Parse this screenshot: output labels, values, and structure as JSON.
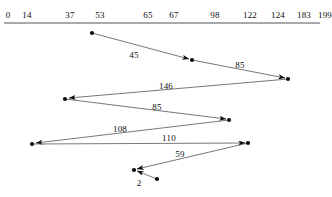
{
  "figure": {
    "type": "tour-diagram",
    "background_color": "#ffffff",
    "ink_color": "#0d0d0d",
    "line_color": "#555555",
    "width": 332,
    "height": 197
  },
  "axis": {
    "name": "position-axis",
    "y": 23,
    "x_start": 4,
    "x_end": 320,
    "ticks": [
      {
        "label": "0",
        "x": 8
      },
      {
        "label": "14",
        "x": 27
      },
      {
        "label": "37",
        "x": 70
      },
      {
        "label": "53",
        "x": 100
      },
      {
        "label": "65",
        "x": 148
      },
      {
        "label": "67",
        "x": 174
      },
      {
        "label": "98",
        "x": 215
      },
      {
        "label": "122",
        "x": 250
      },
      {
        "label": "124",
        "x": 278
      },
      {
        "label": "183",
        "x": 304
      },
      {
        "label": "199",
        "x": 325
      }
    ]
  },
  "nodes": [
    {
      "name": "node-start",
      "x": 92,
      "y": 33
    },
    {
      "name": "node-mid-1",
      "x": 192,
      "y": 60
    },
    {
      "name": "node-right-1",
      "x": 288,
      "y": 79
    },
    {
      "name": "node-left-1",
      "x": 65,
      "y": 99
    },
    {
      "name": "node-right-2",
      "x": 229,
      "y": 120
    },
    {
      "name": "node-left-2",
      "x": 32,
      "y": 144
    },
    {
      "name": "node-right-3",
      "x": 248,
      "y": 143
    },
    {
      "name": "node-mid-2",
      "x": 134,
      "y": 170
    },
    {
      "name": "node-end",
      "x": 157,
      "y": 179
    }
  ],
  "edges": [
    {
      "name": "edge-45",
      "label": "45",
      "x1": 92,
      "y1": 33,
      "x2": 189,
      "y2": 59,
      "label_x": 134,
      "label_y": 55
    },
    {
      "name": "edge-85a",
      "label": "85",
      "x1": 192,
      "y1": 60,
      "x2": 285,
      "y2": 78,
      "label_x": 240,
      "label_y": 65
    },
    {
      "name": "edge-146",
      "label": "146",
      "x1": 288,
      "y1": 79,
      "x2": 69,
      "y2": 98,
      "label_x": 166,
      "label_y": 86
    },
    {
      "name": "edge-85b",
      "label": "85",
      "x1": 65,
      "y1": 99,
      "x2": 226,
      "y2": 119,
      "label_x": 157,
      "label_y": 107
    },
    {
      "name": "edge-108",
      "label": "108",
      "x1": 229,
      "y1": 120,
      "x2": 36,
      "y2": 143,
      "label_x": 120,
      "label_y": 129
    },
    {
      "name": "edge-110",
      "label": "110",
      "x1": 32,
      "y1": 144,
      "x2": 245,
      "y2": 143,
      "label_x": 169,
      "label_y": 138
    },
    {
      "name": "edge-59",
      "label": "59",
      "x1": 248,
      "y1": 143,
      "x2": 137,
      "y2": 169,
      "label_x": 180,
      "label_y": 154
    },
    {
      "name": "edge-2",
      "label": "2",
      "x1": 157,
      "y1": 179,
      "x2": 137,
      "y2": 171,
      "label_x": 139,
      "label_y": 183
    }
  ],
  "chart_data": {
    "type": "diagram",
    "title": "",
    "axis_ticks": [
      0,
      14,
      37,
      53,
      65,
      67,
      98,
      122,
      124,
      183,
      199
    ],
    "edge_values": [
      45,
      85,
      146,
      85,
      108,
      110,
      59,
      2
    ],
    "node_count": 9
  }
}
